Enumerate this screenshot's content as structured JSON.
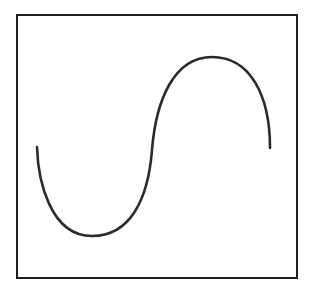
{
  "diagram": {
    "type": "sine-wave-sketch",
    "frame": {
      "x": 16,
      "y": 14,
      "width": 280,
      "height": 263,
      "stroke_color": "#1e1e1e",
      "stroke_width": 2.5
    },
    "curve": {
      "description": "single-period S-shaped sine wave",
      "stroke_color": "#2a2a2a",
      "stroke_width": 2.6,
      "start": [
        37,
        147
      ],
      "trough": [
        92,
        236
      ],
      "midpoint": [
        152,
        150
      ],
      "peak": [
        212,
        57
      ],
      "end": [
        270,
        148
      ],
      "path": "M37,147 C38,180 50,236 92,236 C130,236 148,200 152,150 C156,100 174,57 212,57 C250,57 270,95 270,148"
    }
  }
}
